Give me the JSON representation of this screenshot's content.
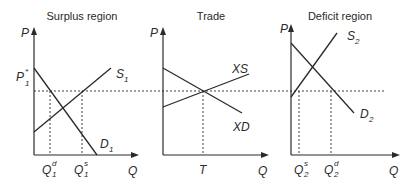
{
  "diagram": {
    "panels": [
      {
        "title": "Surplus region",
        "y_axis_label": "P",
        "x_axis_label": "Q",
        "price_label": "P",
        "price_label_sub": "1",
        "price_label_sup": "*",
        "supply_label": "S",
        "supply_label_sub": "1",
        "demand_label": "D",
        "demand_label_sub": "1",
        "q_demand_label": "Q",
        "q_demand_sub": "1",
        "q_demand_sup": "d",
        "q_supply_label": "Q",
        "q_supply_sub": "1",
        "q_supply_sup": "s"
      },
      {
        "title": "Trade",
        "y_axis_label": "P",
        "x_axis_label": "Q",
        "excess_supply_label": "XS",
        "excess_demand_label": "XD",
        "trade_quantity_label": "T"
      },
      {
        "title": "Deficit region",
        "y_axis_label": "P",
        "x_axis_label": "Q",
        "supply_label": "S",
        "supply_label_sub": "2",
        "demand_label": "D",
        "demand_label_sub": "2",
        "q_supply_label": "Q",
        "q_supply_sub": "2",
        "q_supply_sup": "s",
        "q_demand_label": "Q",
        "q_demand_sub": "2",
        "q_demand_sup": "d"
      }
    ],
    "colors": {
      "ink": "#2a2a2a",
      "background": "#ffffff"
    }
  }
}
